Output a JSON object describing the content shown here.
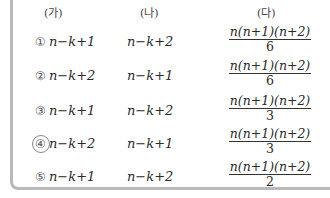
{
  "headers": [
    "(가)",
    "(나)",
    "(다)"
  ],
  "rows": [
    {
      "num": "①",
      "a": "n−k+1",
      "b": "n−k+2",
      "c_num": "n(n+1)(n+2)",
      "c_den": "6"
    },
    {
      "num": "②",
      "a": "n−k+2",
      "b": "n−k+1",
      "c_num": "n(n+1)(n+2)",
      "c_den": "6"
    },
    {
      "num": "③",
      "a": "n−k+1",
      "b": "n−k+2",
      "c_num": "n(n+1)(n+2)",
      "c_den": "3"
    },
    {
      "num": "④",
      "a": "n−k+2",
      "b": "n−k+1",
      "c_num": "n(n+1)(n+2)",
      "c_den": "3"
    },
    {
      "num": "⑤",
      "a": "n−k+1",
      "b": "n−k+2",
      "c_num": "n(n+1)(n+2)",
      "c_den": "2"
    }
  ]
}
